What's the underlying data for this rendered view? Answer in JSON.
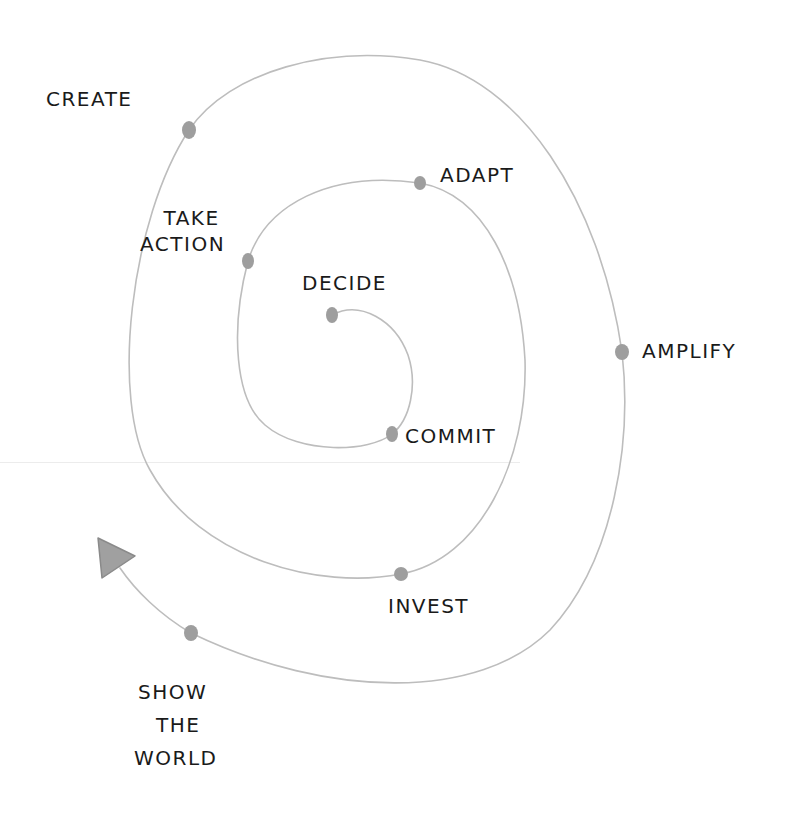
{
  "diagram": {
    "type": "hand-drawn spiral process",
    "colors": {
      "paper": "#ffffff",
      "line": "#bdbdbd",
      "dot": "#9a9a9a",
      "ink": "#1a1a1a",
      "arrowhead": "#9e9e9e"
    },
    "stages": [
      {
        "id": "decide",
        "label": "DECIDE",
        "order": 1
      },
      {
        "id": "commit",
        "label": "COMMIT",
        "order": 2
      },
      {
        "id": "take-action",
        "label_line1": "TAKE",
        "label_line2": "ACTION",
        "order": 3
      },
      {
        "id": "adapt",
        "label": "ADAPT",
        "order": 4
      },
      {
        "id": "invest",
        "label": "INVEST",
        "order": 5
      },
      {
        "id": "create",
        "label": "CREATE",
        "order": 6
      },
      {
        "id": "amplify",
        "label": "AMPLIFY",
        "order": 7
      },
      {
        "id": "show-the-world",
        "label_line1": "SHOW",
        "label_line2": "THE",
        "label_line3": "WORLD",
        "order": 8
      }
    ],
    "end_marker": "arrowhead-outward"
  }
}
